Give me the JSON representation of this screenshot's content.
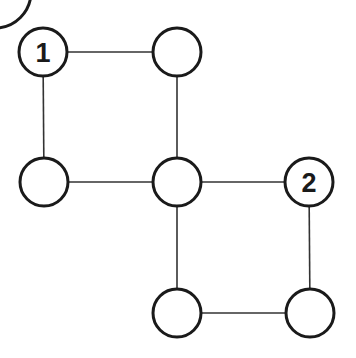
{
  "diagram": {
    "colors": {
      "stroke": "#1a1a1a",
      "edge": "#333333",
      "fill": "#ffffff"
    },
    "nodes": [
      {
        "id": "n1",
        "label": "1",
        "x": 43,
        "y": 52
      },
      {
        "id": "n2",
        "label": "",
        "x": 177,
        "y": 52
      },
      {
        "id": "n3",
        "label": "",
        "x": 44,
        "y": 182
      },
      {
        "id": "n4",
        "label": "",
        "x": 177,
        "y": 182
      },
      {
        "id": "n5",
        "label": "2",
        "x": 309,
        "y": 182
      },
      {
        "id": "n6",
        "label": "",
        "x": 177,
        "y": 313
      },
      {
        "id": "n7",
        "label": "",
        "x": 310,
        "y": 313
      }
    ],
    "edges": [
      [
        "n1",
        "n2"
      ],
      [
        "n1",
        "n3"
      ],
      [
        "n2",
        "n4"
      ],
      [
        "n3",
        "n4"
      ],
      [
        "n4",
        "n5"
      ],
      [
        "n4",
        "n6"
      ],
      [
        "n5",
        "n7"
      ],
      [
        "n6",
        "n7"
      ]
    ],
    "partial_corner_circle": {
      "x": -5,
      "y": -8,
      "r": 36
    }
  }
}
